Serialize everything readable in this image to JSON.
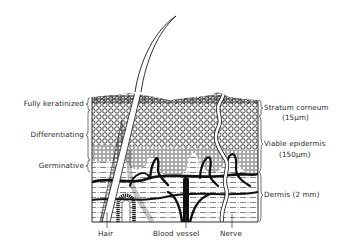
{
  "diagram": {
    "left_labels": [
      {
        "text": "Fully keratinized"
      },
      {
        "text": "Differentiating"
      },
      {
        "text": "Germinative"
      }
    ],
    "right_labels": [
      {
        "text": "Stratum corneum",
        "sub": "(15μm)"
      },
      {
        "text": "Viable epidermis",
        "sub": "(150μm)"
      },
      {
        "text": "Dermis (2 mm)"
      }
    ],
    "bottom_labels": [
      {
        "text": "Hair"
      },
      {
        "text": "Blood vessel"
      },
      {
        "text": "Nerve"
      }
    ],
    "colors": {
      "ink": "#1a1a1a",
      "background": "#ffffff"
    }
  }
}
